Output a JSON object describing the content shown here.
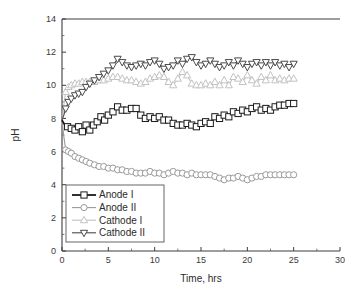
{
  "figure": {
    "background": "#ffffff",
    "frame_color": "#3c3c3c"
  },
  "chart_data": {
    "type": "line",
    "title": "",
    "subtitle": "",
    "xlabel": "Time, hrs",
    "ylabel": "pH",
    "xlim": [
      0,
      30
    ],
    "ylim": [
      0,
      14
    ],
    "xticks": [
      0,
      5,
      10,
      15,
      20,
      25,
      30
    ],
    "yticks": [
      0,
      2,
      4,
      6,
      8,
      10,
      12,
      14
    ],
    "xtick_labels": [
      "0",
      "5",
      "10",
      "15",
      "20",
      "25",
      "30"
    ],
    "ytick_labels": [
      "0",
      "2",
      "4",
      "6",
      "8",
      "10",
      "12",
      "14"
    ],
    "x_minor_interval": 2.5,
    "y_minor_interval": 1,
    "grid": false,
    "legend_position": "lower-left",
    "series": [
      {
        "name": "Anode I",
        "marker": "square",
        "color": "#1a1a1a",
        "line_width": 1.8,
        "x": [
          0.0,
          0.3,
          0.6,
          1.0,
          1.4,
          1.8,
          2.2,
          2.6,
          3.0,
          3.4,
          3.8,
          4.2,
          4.6,
          5.0,
          5.5,
          6.0,
          6.5,
          7.0,
          7.5,
          8.0,
          8.5,
          9.0,
          9.5,
          10.0,
          10.5,
          11.0,
          11.5,
          12.0,
          12.5,
          13.0,
          13.5,
          14.0,
          14.5,
          15.0,
          15.5,
          16.0,
          16.5,
          17.0,
          17.5,
          18.0,
          18.5,
          19.0,
          19.5,
          20.0,
          20.5,
          21.0,
          21.5,
          22.0,
          22.5,
          23.0,
          23.5,
          24.0,
          24.5,
          25.0
        ],
        "y": [
          7.9,
          7.6,
          7.5,
          7.4,
          7.3,
          7.5,
          7.2,
          7.6,
          7.3,
          7.6,
          7.8,
          8.1,
          7.9,
          8.2,
          8.4,
          8.7,
          8.5,
          8.5,
          8.6,
          8.6,
          8.2,
          8.0,
          8.1,
          8.0,
          8.1,
          7.9,
          7.9,
          7.7,
          7.6,
          7.6,
          7.7,
          7.6,
          7.5,
          7.7,
          7.8,
          7.7,
          8.1,
          8.0,
          8.2,
          8.1,
          8.4,
          8.3,
          8.5,
          8.4,
          8.6,
          8.7,
          8.5,
          8.6,
          8.5,
          8.7,
          8.8,
          8.8,
          8.9,
          8.9
        ]
      },
      {
        "name": "Anode II",
        "marker": "circle",
        "color": "#9a9a9a",
        "line_width": 1.1,
        "x": [
          0.0,
          0.2,
          0.4,
          0.7,
          1.0,
          1.4,
          1.8,
          2.2,
          2.6,
          3.0,
          3.5,
          4.0,
          4.5,
          5.0,
          5.5,
          6.0,
          6.5,
          7.0,
          7.5,
          8.0,
          8.5,
          9.0,
          9.5,
          10.0,
          10.5,
          11.0,
          11.5,
          12.0,
          12.5,
          13.0,
          13.5,
          14.0,
          14.5,
          15.0,
          15.5,
          16.0,
          16.5,
          17.0,
          17.5,
          18.0,
          18.5,
          19.0,
          19.5,
          20.0,
          20.5,
          21.0,
          21.5,
          22.0,
          22.5,
          23.0,
          23.5,
          24.0,
          24.5,
          25.0
        ],
        "y": [
          7.9,
          6.9,
          6.1,
          6.0,
          5.9,
          5.7,
          5.6,
          5.5,
          5.4,
          5.3,
          5.2,
          5.1,
          5.1,
          5.0,
          5.0,
          4.9,
          4.9,
          4.8,
          4.8,
          4.7,
          4.7,
          4.7,
          4.8,
          4.7,
          4.7,
          4.6,
          4.7,
          4.8,
          4.7,
          4.7,
          4.6,
          4.7,
          4.6,
          4.6,
          4.6,
          4.6,
          4.5,
          4.4,
          4.3,
          4.4,
          4.4,
          4.5,
          4.4,
          4.3,
          4.4,
          4.5,
          4.5,
          4.6,
          4.6,
          4.6,
          4.6,
          4.6,
          4.6,
          4.6
        ]
      },
      {
        "name": "Cathode I",
        "marker": "triangle-up",
        "color": "#c2c2c2",
        "line_width": 1.1,
        "x": [
          0.0,
          0.2,
          0.4,
          0.7,
          1.0,
          1.4,
          1.8,
          2.2,
          2.6,
          3.0,
          3.5,
          4.0,
          4.5,
          5.0,
          5.5,
          6.0,
          6.5,
          7.0,
          7.5,
          8.0,
          8.5,
          9.0,
          9.5,
          10.0,
          10.5,
          11.0,
          11.5,
          12.0,
          12.5,
          13.0,
          13.5,
          14.0,
          14.5,
          15.0,
          15.5,
          16.0,
          16.5,
          17.0,
          17.5,
          18.0,
          18.5,
          19.0,
          19.5,
          20.0,
          20.5,
          21.0,
          21.5,
          22.0,
          22.5,
          23.0,
          23.5,
          24.0,
          24.5,
          25.0
        ],
        "y": [
          7.6,
          8.8,
          9.6,
          9.9,
          10.0,
          10.1,
          10.1,
          10.2,
          10.2,
          10.2,
          10.2,
          10.3,
          10.3,
          10.4,
          10.5,
          10.5,
          10.4,
          10.3,
          10.3,
          10.2,
          10.1,
          10.2,
          10.4,
          10.5,
          10.6,
          10.5,
          10.2,
          10.0,
          10.4,
          10.8,
          10.6,
          10.1,
          10.0,
          10.0,
          10.1,
          10.0,
          10.2,
          10.0,
          10.3,
          10.0,
          10.5,
          10.4,
          10.2,
          10.6,
          10.3,
          10.1,
          10.5,
          10.3,
          10.6,
          10.3,
          10.4,
          10.3,
          10.4,
          10.4
        ]
      },
      {
        "name": "Cathode II",
        "marker": "triangle-down",
        "color": "#4a4a4a",
        "line_width": 1.1,
        "x": [
          0.0,
          0.2,
          0.4,
          0.7,
          1.0,
          1.4,
          1.8,
          2.2,
          2.6,
          3.0,
          3.5,
          4.0,
          4.5,
          5.0,
          5.5,
          6.0,
          6.5,
          7.0,
          7.5,
          8.0,
          8.5,
          9.0,
          9.5,
          10.0,
          10.5,
          11.0,
          11.5,
          12.0,
          12.5,
          13.0,
          13.5,
          14.0,
          14.5,
          15.0,
          15.5,
          16.0,
          16.5,
          17.0,
          17.5,
          18.0,
          18.5,
          19.0,
          19.5,
          20.0,
          20.5,
          21.0,
          21.5,
          22.0,
          22.5,
          23.0,
          23.5,
          24.0,
          24.5,
          25.0
        ],
        "y": [
          7.9,
          8.2,
          8.6,
          9.0,
          9.2,
          9.4,
          9.5,
          9.6,
          9.9,
          10.1,
          10.3,
          10.5,
          10.7,
          10.9,
          11.2,
          11.6,
          11.4,
          11.2,
          11.1,
          11.2,
          11.3,
          11.2,
          11.4,
          11.5,
          11.3,
          11.0,
          11.1,
          11.2,
          11.5,
          11.3,
          11.6,
          11.7,
          11.4,
          11.2,
          11.3,
          11.5,
          11.3,
          11.1,
          11.2,
          11.4,
          11.2,
          11.5,
          11.3,
          11.1,
          11.3,
          11.4,
          11.2,
          11.4,
          11.2,
          11.4,
          11.2,
          11.3,
          11.1,
          11.3
        ]
      }
    ]
  },
  "legend": {
    "entries": [
      {
        "label": "Anode I"
      },
      {
        "label": "Anode II"
      },
      {
        "label": "Cathode I"
      },
      {
        "label": "Cathode II"
      }
    ]
  }
}
